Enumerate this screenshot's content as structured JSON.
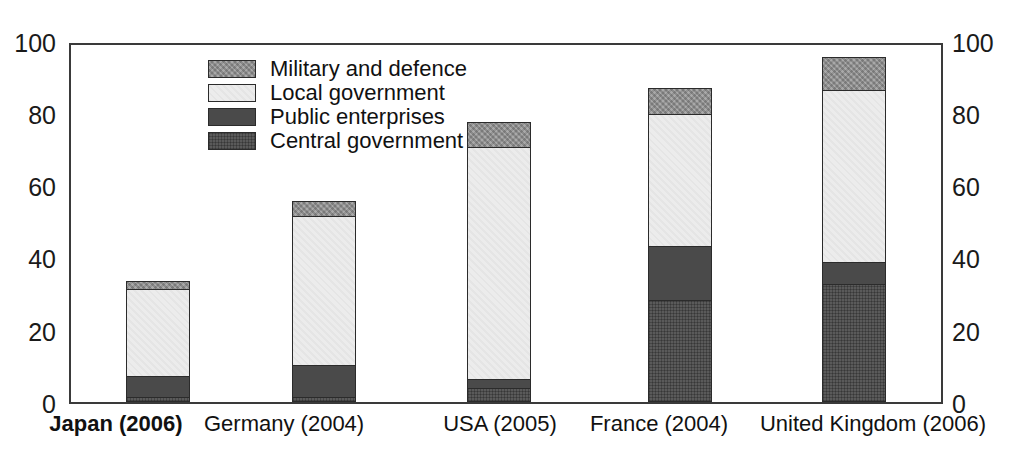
{
  "chart_data": {
    "type": "bar",
    "subtype": "stacked-bar",
    "title": "",
    "xlabel": "",
    "ylabel": "",
    "ylim": [
      0,
      100
    ],
    "yticks": [
      0,
      20,
      40,
      60,
      80,
      100
    ],
    "ytick_labels_left": [
      "0",
      "20",
      "40",
      "60",
      "80",
      "100"
    ],
    "ytick_labels_right": [
      "0",
      "20",
      "40",
      "60",
      "80",
      "100"
    ],
    "grid": false,
    "legend_position": "upper-left-inside",
    "dual_axis": true,
    "categories": [
      "Japan (2006)",
      "Germany (2004)",
      "USA (2005)",
      "France (2004)",
      "United Kingdom (2006)"
    ],
    "highlighted_category": "Japan (2006)",
    "series": [
      {
        "name": "Central government",
        "color": "#5a5a5a",
        "values": [
          1.0,
          1.0,
          3.6,
          28.3,
          32.7
        ]
      },
      {
        "name": "Public enterprises",
        "color": "#4a4a4a",
        "values": [
          6.0,
          9.0,
          2.5,
          15.0,
          6.1
        ]
      },
      {
        "name": "Local government",
        "color": "#ececec",
        "values": [
          24.3,
          41.8,
          65.0,
          37.2,
          48.2
        ]
      },
      {
        "name": "Military and defence",
        "color": "#a9a9a9",
        "values": [
          2.2,
          4.1,
          7.0,
          7.0,
          9.3
        ]
      }
    ],
    "stack_order_bottom_to_top": [
      "Central government",
      "Public enterprises",
      "Local government",
      "Military and defence"
    ],
    "totals": [
      33.5,
      55.9,
      78.1,
      87.5,
      96.3
    ]
  },
  "legend": {
    "entries": [
      {
        "label": "Military and defence",
        "swatch": "military-swatch"
      },
      {
        "label": "Local government",
        "swatch": "local-swatch"
      },
      {
        "label": "Public enterprises",
        "swatch": "public-swatch"
      },
      {
        "label": "Central government",
        "swatch": "central-swatch"
      }
    ]
  }
}
